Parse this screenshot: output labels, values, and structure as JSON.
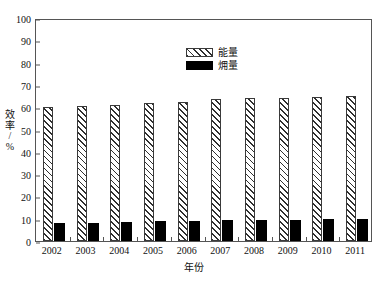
{
  "chart_data": {
    "type": "bar",
    "title": "",
    "subtitle": "",
    "xlabel": "年份",
    "ylabel": "效率/%",
    "categories": [
      "2002",
      "2003",
      "2004",
      "2005",
      "2006",
      "2007",
      "2008",
      "2009",
      "2010",
      "2011"
    ],
    "series": [
      {
        "name": "能量",
        "style": "hatched",
        "color": "#ffffff",
        "edge_color": "#2f2f2f",
        "values": [
          60.0,
          60.5,
          61.2,
          62.0,
          62.3,
          63.5,
          64.0,
          64.2,
          64.8,
          65.0
        ]
      },
      {
        "name": "㶲量",
        "style": "solid",
        "color": "#000000",
        "edge_color": "#000000",
        "values": [
          8.0,
          8.3,
          8.5,
          8.8,
          9.0,
          9.2,
          9.5,
          9.6,
          9.8,
          10.0
        ]
      }
    ],
    "ylim": [
      0,
      100
    ],
    "ytick_step": 10,
    "yticks": [
      "100",
      "90",
      "80",
      "70",
      "60",
      "50",
      "40",
      "30",
      "20",
      "10",
      "0"
    ],
    "grid": false,
    "legend_position": "upper-center",
    "frame": true
  },
  "axes": {
    "y_title_chars": [
      "效",
      "率",
      "/",
      "%"
    ],
    "x_title": "年份"
  },
  "legend": {
    "entries": [
      {
        "label": "能量",
        "swatch": "hatched-swatch"
      },
      {
        "label": "㶲量",
        "swatch": "black-swatch"
      }
    ]
  }
}
